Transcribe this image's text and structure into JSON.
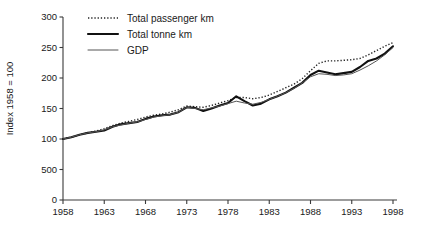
{
  "chart_data": {
    "type": "line",
    "title": "",
    "subtitle": "",
    "xlabel": "",
    "ylabel": "Index 1958 = 100",
    "xlim": [
      1958,
      1998
    ],
    "ylim": [
      0,
      300
    ],
    "grid": false,
    "legend_position": "top-left",
    "ytick_labels": [
      "0",
      "500",
      "100",
      "150",
      "200",
      "250",
      "300"
    ],
    "ytick_values": [
      0,
      50,
      100,
      150,
      200,
      250,
      300
    ],
    "xtick_labels": [
      "1958",
      "1963",
      "1968",
      "1973",
      "1978",
      "1983",
      "1988",
      "1993",
      "1998"
    ],
    "xtick_values": [
      1958,
      1963,
      1968,
      1973,
      1978,
      1983,
      1988,
      1993,
      1998
    ],
    "x": [
      1958,
      1959,
      1960,
      1961,
      1962,
      1963,
      1964,
      1965,
      1966,
      1967,
      1968,
      1969,
      1970,
      1971,
      1972,
      1973,
      1974,
      1975,
      1976,
      1977,
      1978,
      1979,
      1980,
      1981,
      1982,
      1983,
      1984,
      1985,
      1986,
      1987,
      1988,
      1989,
      1990,
      1991,
      1992,
      1993,
      1994,
      1995,
      1996,
      1997,
      1998
    ],
    "series": [
      {
        "name": "Total passenger km",
        "style": "dotted",
        "color": "#222222",
        "width": 1.4,
        "values": [
          100,
          103,
          107,
          110,
          113,
          117,
          122,
          126,
          129,
          132,
          136,
          139,
          141,
          144,
          148,
          154,
          153,
          152,
          155,
          159,
          163,
          168,
          168,
          166,
          168,
          172,
          178,
          184,
          190,
          199,
          212,
          224,
          228,
          228,
          229,
          230,
          232,
          238,
          245,
          252,
          258
        ]
      },
      {
        "name": "Total tonne km",
        "style": "solid-thick",
        "color": "#111111",
        "width": 2.1,
        "values": [
          100,
          103,
          107,
          110,
          112,
          114,
          120,
          124,
          126,
          128,
          133,
          137,
          139,
          140,
          144,
          152,
          151,
          146,
          150,
          155,
          159,
          170,
          162,
          155,
          158,
          165,
          170,
          176,
          184,
          192,
          205,
          212,
          209,
          206,
          208,
          210,
          218,
          228,
          232,
          240,
          252
        ]
      },
      {
        "name": "GDP",
        "style": "solid-thin",
        "color": "#555555",
        "width": 1.0,
        "values": [
          100,
          103,
          107,
          110,
          112,
          115,
          120,
          123,
          126,
          128,
          132,
          136,
          138,
          140,
          144,
          152,
          150,
          148,
          151,
          154,
          158,
          162,
          159,
          157,
          160,
          165,
          170,
          176,
          183,
          192,
          202,
          207,
          206,
          204,
          205,
          207,
          213,
          220,
          228,
          238,
          250
        ]
      }
    ]
  },
  "legend": {
    "items": [
      {
        "label": "Total passenger km",
        "style": "dotted"
      },
      {
        "label": "Total tonne km",
        "style": "solid-thick"
      },
      {
        "label": "GDP",
        "style": "solid-thin"
      }
    ]
  }
}
